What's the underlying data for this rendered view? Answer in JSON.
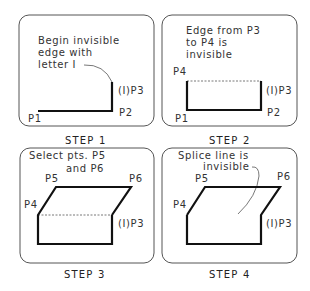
{
  "panels": [
    {
      "caption": "STEP 1",
      "note": [
        "Begin invisible",
        "edge with",
        "letter I"
      ],
      "points": {
        "p1": "P1",
        "p2": "P2",
        "p3": "(I)P3"
      }
    },
    {
      "caption": "STEP 2",
      "note": [
        "Edge from P3",
        "to P4 is",
        "invisible"
      ],
      "points": {
        "p1": "P1",
        "p2": "P2",
        "p3": "(I)P3",
        "p4": "P4"
      }
    },
    {
      "caption": "STEP 3",
      "note": [
        "Select pts. P5",
        "and P6"
      ],
      "points": {
        "p3": "(I)P3",
        "p4": "P4",
        "p5": "P5",
        "p6": "P6"
      }
    },
    {
      "caption": "STEP 4",
      "note": [
        "Splice line is",
        "invisible"
      ],
      "points": {
        "p3": "(I)P3",
        "p4": "P4",
        "p5": "P5",
        "p6": "P6"
      }
    }
  ]
}
